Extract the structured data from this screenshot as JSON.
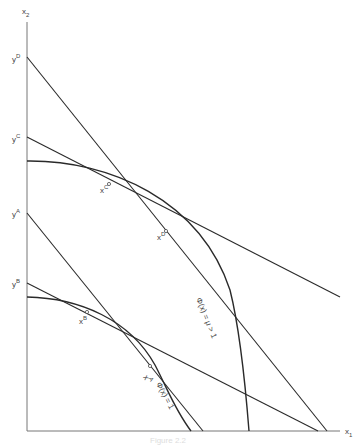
{
  "figure": {
    "axes": {
      "x_label": "x",
      "x_sub": "1",
      "y_label": "x",
      "y_sub": "2"
    },
    "intercept_labels": [
      {
        "base": "y",
        "sup": "D"
      },
      {
        "base": "y",
        "sup": "C"
      },
      {
        "base": "y",
        "sup": "A"
      },
      {
        "base": "y",
        "sup": "B"
      }
    ],
    "point_labels": [
      {
        "base": "x",
        "sup": "C"
      },
      {
        "base": "x",
        "sup": "D"
      },
      {
        "base": "x",
        "sup": "B"
      },
      {
        "base": "x",
        "sup": "A"
      }
    ],
    "curve_labels": {
      "outer": "Φ(x) = μ > 1",
      "inner": "Φ(x) = 1"
    },
    "caption": "Figure 2.2"
  },
  "colors": {
    "line": "#2a2a2a",
    "axis": "#777777"
  }
}
